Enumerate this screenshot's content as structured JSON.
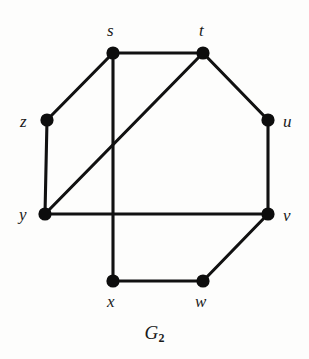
{
  "figure": {
    "caption_base": "G",
    "caption_subscript": "2",
    "caption_full": "G2",
    "background_color": "#fdfdfc",
    "ink_color": "#111111"
  },
  "chart_data": {
    "type": "diagram",
    "diagram_kind": "undirected-graph",
    "title": "G2",
    "vertex_count": 8,
    "edge_count": 10,
    "vertex_radius_px": 6.6,
    "edge_stroke_px": 3.1,
    "nodes": [
      {
        "id": "s",
        "label": "s",
        "x": 113,
        "y": 53,
        "label_x": 107,
        "label_y": 22,
        "label_pos": "above"
      },
      {
        "id": "t",
        "label": "t",
        "x": 203,
        "y": 53,
        "label_x": 199,
        "label_y": 22,
        "label_pos": "above"
      },
      {
        "id": "z",
        "label": "z",
        "x": 47,
        "y": 120,
        "label_x": 20,
        "label_y": 113,
        "label_pos": "left"
      },
      {
        "id": "u",
        "label": "u",
        "x": 268,
        "y": 120,
        "label_x": 283,
        "label_y": 113,
        "label_pos": "right"
      },
      {
        "id": "y",
        "label": "y",
        "x": 45,
        "y": 214,
        "label_x": 19,
        "label_y": 206,
        "label_pos": "left"
      },
      {
        "id": "v",
        "label": "v",
        "x": 268,
        "y": 214,
        "label_x": 283,
        "label_y": 207,
        "label_pos": "right"
      },
      {
        "id": "x",
        "label": "x",
        "x": 113,
        "y": 281,
        "label_x": 107,
        "label_y": 293,
        "label_pos": "below"
      },
      {
        "id": "w",
        "label": "w",
        "x": 203,
        "y": 281,
        "label_x": 195,
        "label_y": 293,
        "label_pos": "below"
      }
    ],
    "edges": [
      {
        "source": "s",
        "target": "t",
        "x1": 113,
        "y1": 53,
        "x2": 203,
        "y2": 53
      },
      {
        "source": "s",
        "target": "z",
        "x1": 113,
        "y1": 53,
        "x2": 47,
        "y2": 120
      },
      {
        "source": "s",
        "target": "x",
        "x1": 113,
        "y1": 53,
        "x2": 113,
        "y2": 281
      },
      {
        "source": "t",
        "target": "u",
        "x1": 203,
        "y1": 53,
        "x2": 268,
        "y2": 120
      },
      {
        "source": "t",
        "target": "y",
        "x1": 203,
        "y1": 53,
        "x2": 45,
        "y2": 214
      },
      {
        "source": "z",
        "target": "y",
        "x1": 47,
        "y1": 120,
        "x2": 45,
        "y2": 214
      },
      {
        "source": "u",
        "target": "v",
        "x1": 268,
        "y1": 120,
        "x2": 268,
        "y2": 214
      },
      {
        "source": "y",
        "target": "v",
        "x1": 45,
        "y1": 214,
        "x2": 268,
        "y2": 214
      },
      {
        "source": "v",
        "target": "w",
        "x1": 268,
        "y1": 214,
        "x2": 203,
        "y2": 281
      },
      {
        "source": "w",
        "target": "x",
        "x1": 203,
        "y1": 281,
        "x2": 113,
        "y2": 281
      }
    ],
    "adjacency": {
      "s": [
        "t",
        "z",
        "x"
      ],
      "t": [
        "s",
        "u",
        "y"
      ],
      "u": [
        "t",
        "v"
      ],
      "v": [
        "u",
        "y",
        "w"
      ],
      "w": [
        "v",
        "x"
      ],
      "x": [
        "s",
        "w"
      ],
      "y": [
        "t",
        "z",
        "v"
      ],
      "z": [
        "s",
        "y"
      ]
    },
    "degrees": {
      "s": 3,
      "t": 3,
      "u": 2,
      "v": 3,
      "w": 2,
      "x": 2,
      "y": 3,
      "z": 2
    },
    "crossings": [
      {
        "edge_a": "t-y",
        "edge_b": "s-x",
        "approx_x": 113,
        "approx_y": 144
      }
    ]
  }
}
